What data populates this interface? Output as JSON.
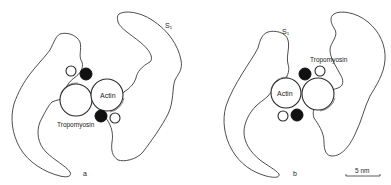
{
  "figure": {
    "panels": [
      {
        "id": "a",
        "panel_label": "a",
        "labels": {
          "s1": "S₁",
          "actin": "Actin",
          "tropomyosin": "Tropomyosin"
        }
      },
      {
        "id": "b",
        "panel_label": "b",
        "labels": {
          "s1": "S₁",
          "actin": "Actin",
          "tropomyosin": "Tropomyosin"
        }
      }
    ],
    "scale_bar": {
      "label": "5 nm"
    },
    "colors": {
      "line": "#3a3a3a",
      "filled": "#111111",
      "background": "#ffffff"
    }
  }
}
